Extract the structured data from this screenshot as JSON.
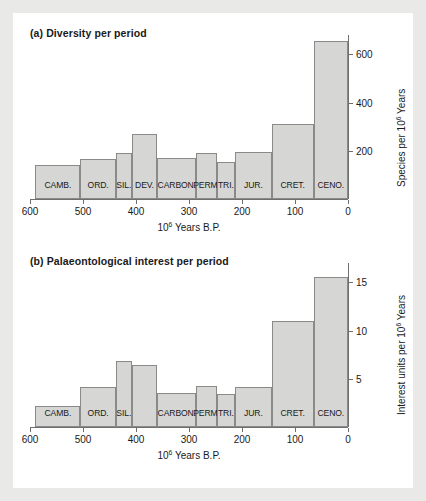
{
  "figure": {
    "background": "#e9e9e7",
    "paper": "#ffffff",
    "bar_fill": "#d6d6d4",
    "bar_stroke": "#8a8a88",
    "axis_color": "#6f6f6f"
  },
  "panels": [
    {
      "id": "a",
      "title": "(a) Diversity per period",
      "xlabel_pre": "10",
      "xlabel_sup": "6",
      "xlabel_post": " Years B.P.",
      "ylabel_pre": "Species per 10",
      "ylabel_sup": "6",
      "ylabel_post": " Years"
    },
    {
      "id": "b",
      "title": "(b) Palaeontological interest per period",
      "xlabel_pre": "10",
      "xlabel_sup": "6",
      "xlabel_post": " Years B.P.",
      "ylabel_pre": "Interest units per 10",
      "ylabel_sup": "6",
      "ylabel_post": " Years"
    }
  ],
  "chart_data": [
    {
      "type": "bar",
      "title": "(a) Diversity per period",
      "xlabel": "10^6 Years B.P.",
      "ylabel": "Species per 10^6 Years",
      "xlim": [
        600,
        0
      ],
      "ylim": [
        0,
        680
      ],
      "xticks": [
        600,
        500,
        400,
        300,
        200,
        100,
        0
      ],
      "yticks": [
        200,
        400,
        600
      ],
      "grid": false,
      "x_axis_reversed": true,
      "bin_edges_myr": [
        590,
        505,
        438,
        408,
        360,
        286,
        248,
        213,
        144,
        65,
        0
      ],
      "categories": [
        "CAMB.",
        "ORD.",
        "SIL.",
        "DEV.",
        "CARBON.",
        "PERM.",
        "TRI.",
        "JUR.",
        "CRET.",
        "CENO."
      ],
      "values": [
        140,
        165,
        190,
        270,
        170,
        190,
        155,
        195,
        310,
        655
      ]
    },
    {
      "type": "bar",
      "title": "(b) Palaeontological interest per period",
      "xlabel": "10^6 Years B.P.",
      "ylabel": "Interest units per 10^6 Years",
      "xlim": [
        600,
        0
      ],
      "ylim": [
        0,
        17
      ],
      "xticks": [
        600,
        500,
        400,
        300,
        200,
        100,
        0
      ],
      "yticks": [
        5,
        10,
        15
      ],
      "grid": false,
      "x_axis_reversed": true,
      "bin_edges_myr": [
        590,
        505,
        438,
        408,
        360,
        286,
        248,
        213,
        144,
        65,
        0
      ],
      "categories": [
        "CAMB.",
        "ORD.",
        "SIL.",
        "",
        "CARBON.",
        "PERM.",
        "TRI.",
        "JUR.",
        "CRET.",
        "CENO."
      ],
      "values": [
        2.2,
        4.1,
        6.8,
        6.4,
        3.5,
        4.2,
        3.4,
        4.1,
        11.0,
        15.5
      ]
    }
  ]
}
